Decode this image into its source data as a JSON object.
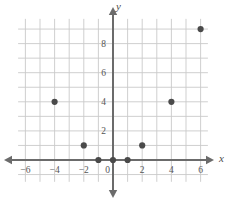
{
  "chart_data": {
    "type": "scatter",
    "title": "",
    "subtitle": "",
    "xlabel": "x",
    "ylabel": "y",
    "grid": true,
    "legend": null,
    "xlim": [
      -6.6,
      6.6
    ],
    "ylim": [
      -1.6,
      9.9
    ],
    "xticks": [
      -6,
      -4,
      -2,
      0,
      2,
      4,
      6
    ],
    "xtick_labels": [
      "-6",
      "-4",
      "-2",
      "0",
      "2",
      "4",
      "6"
    ],
    "yticks": [
      2,
      4,
      6,
      8
    ],
    "ytick_labels": [
      "2",
      "4",
      "6",
      "8"
    ],
    "grid_step": 1,
    "points": [
      {
        "x": -4,
        "y": 4
      },
      {
        "x": -2,
        "y": 1
      },
      {
        "x": -1,
        "y": 0
      },
      {
        "x": 0,
        "y": 0
      },
      {
        "x": 1,
        "y": 0
      },
      {
        "x": 2,
        "y": 1
      },
      {
        "x": 4,
        "y": 4
      },
      {
        "x": 6,
        "y": 9
      }
    ],
    "series": [
      {
        "name": "",
        "x": [
          -4,
          -2,
          -1,
          0,
          1,
          2,
          4,
          6
        ],
        "values": [
          4,
          1,
          0,
          0,
          0,
          1,
          4,
          9
        ]
      }
    ],
    "colors": {
      "point": "#4a4a4a",
      "axis": "#6b6b6b",
      "grid": "#c9c9c9",
      "tick_label": "#555555",
      "background": "#ffffff"
    },
    "point_radius": 3.1,
    "axis_arrows": [
      "x-negative",
      "x-positive",
      "y-negative",
      "y-positive"
    ]
  }
}
